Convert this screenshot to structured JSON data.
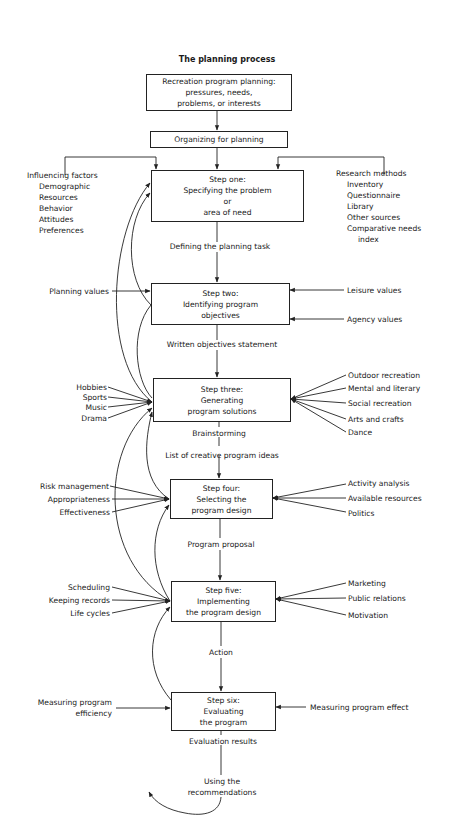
{
  "title": "The planning process",
  "boxes": {
    "start": {
      "lines": [
        "Recreation program planning:",
        "pressures, needs,",
        "problems, or interests"
      ]
    },
    "organizing": {
      "lines": [
        "Organizing for planning"
      ]
    },
    "step1": {
      "lines": [
        "Step one:",
        "Specifying the problem",
        "or",
        "area of need"
      ]
    },
    "step2": {
      "lines": [
        "Step two:",
        "Identifying program",
        "objectives"
      ]
    },
    "step3": {
      "lines": [
        "Step three:",
        "Generating",
        "program solutions"
      ]
    },
    "step4": {
      "lines": [
        "Step four:",
        "Selecting the",
        "program design"
      ]
    },
    "step5": {
      "lines": [
        "Step five:",
        "Implementing",
        "the program design"
      ]
    },
    "step6": {
      "lines": [
        "Step six:",
        "Evaluating",
        "the program"
      ]
    }
  },
  "connectors": {
    "c1_2": "Defining the planning task",
    "c2_3": "Written objectives statement",
    "c3_brain": "Brainstorming",
    "c3_4": "List of creative program ideas",
    "c4_5": "Program proposal",
    "c5_6": "Action",
    "c6_out": "Evaluation results",
    "recommend": [
      "Using the",
      "recommendations"
    ]
  },
  "inputs": {
    "influencing": {
      "heading": "Influencing factors",
      "items": [
        "Demographic",
        "Resources",
        "Behavior",
        "Attitudes",
        "Preferences"
      ]
    },
    "research": {
      "heading": "Research methods",
      "items": [
        "Inventory",
        "Questionnaire",
        "Library",
        "Other sources",
        "Comparative needs",
        "index"
      ]
    },
    "step2_left": [
      "Planning values"
    ],
    "step2_right": [
      "Leisure values",
      "Agency values"
    ],
    "step3_left": [
      "Hobbies",
      "Sports",
      "Music",
      "Drama"
    ],
    "step3_right": [
      "Outdoor recreation",
      "Mental and literary",
      "Social recreation",
      "Arts and crafts",
      "Dance"
    ],
    "step4_left": [
      "Risk management",
      "Appropriateness",
      "Effectiveness"
    ],
    "step4_right": [
      "Activity analysis",
      "Available resources",
      "Politics"
    ],
    "step5_left": [
      "Scheduling",
      "Keeping records",
      "Life cycles"
    ],
    "step5_right": [
      "Marketing",
      "Public relations",
      "Motivation"
    ],
    "step6_left": [
      "Measuring program",
      "efficiency"
    ],
    "step6_right": [
      "Measuring program effect"
    ]
  }
}
